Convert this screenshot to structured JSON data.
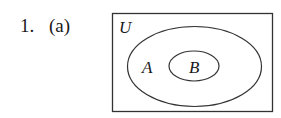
{
  "problem": {
    "number": "1.",
    "part": "(a)"
  },
  "venn": {
    "universe_label": "U",
    "outer_set_label": "A",
    "inner_set_label": "B",
    "relationship": "B is a subset of A, A is a subset of U"
  },
  "colors": {
    "stroke": "#333333",
    "text": "#1a1a1a",
    "background": "#ffffff"
  }
}
